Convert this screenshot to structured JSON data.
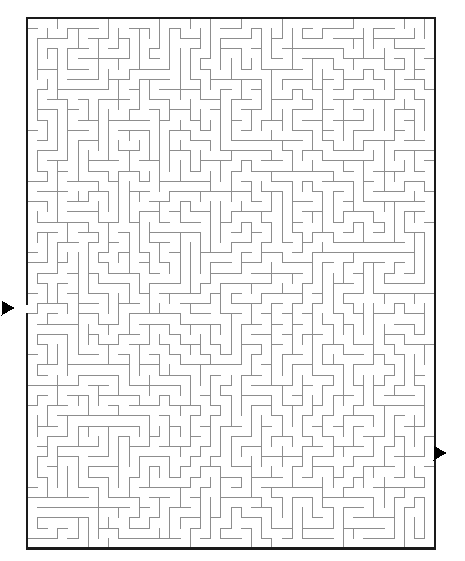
{
  "figure": {
    "kind": "maze-puzzle",
    "title": "Rectangular Maze Puzzle",
    "caption": "",
    "background_color": "#ffffff"
  },
  "maze": {
    "columns": 40,
    "rows": 52,
    "cell_size": 10.2,
    "origin_x": 27,
    "origin_y": 18,
    "width_px": 408,
    "height_px": 528,
    "border_color": "#1a1a1a",
    "border_width": 2.2,
    "wall_color": "#8d8d8d",
    "wall_width": 1,
    "passage_color": "#ffffff",
    "entrance": {
      "label": "entrance",
      "side": "left",
      "row": 28,
      "gap_y_start": 303,
      "gap_y_end": 313,
      "marker": "triangle-right",
      "marker_color": "#000000",
      "marker_x": 8,
      "marker_y": 308
    },
    "exit": {
      "label": "exit",
      "side": "right",
      "row": 42,
      "gap_y_start": 448,
      "gap_y_end": 458,
      "marker": "triangle-right",
      "marker_color": "#000000",
      "marker_x": 440,
      "marker_y": 453
    },
    "seed": 20481,
    "solution_shown": false
  },
  "labels": {
    "entrance_text": "",
    "exit_text": "",
    "instructions": ""
  }
}
